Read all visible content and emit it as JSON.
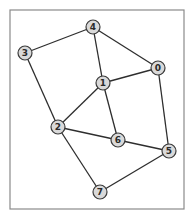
{
  "diagram": {
    "type": "undirected-graph",
    "frame": {
      "x": 10,
      "y": 10,
      "width": 174,
      "height": 199,
      "stroke": "#8a8a8a"
    },
    "style": {
      "edge_color": "#2e2e2e",
      "node_fill": "#d9d9d9",
      "node_stroke": "#3a3a3a",
      "node_radius": 7
    },
    "nodes": [
      {
        "id": "0",
        "label": "0",
        "x": 158,
        "y": 68
      },
      {
        "id": "1",
        "label": "1",
        "x": 103,
        "y": 83
      },
      {
        "id": "2",
        "label": "2",
        "x": 58,
        "y": 127
      },
      {
        "id": "3",
        "label": "3",
        "x": 25,
        "y": 53
      },
      {
        "id": "4",
        "label": "4",
        "x": 93,
        "y": 27
      },
      {
        "id": "5",
        "label": "5",
        "x": 169,
        "y": 151
      },
      {
        "id": "6",
        "label": "6",
        "x": 118,
        "y": 140
      },
      {
        "id": "7",
        "label": "7",
        "x": 100,
        "y": 192
      }
    ],
    "edges": [
      [
        "4",
        "3"
      ],
      [
        "4",
        "1"
      ],
      [
        "4",
        "0"
      ],
      [
        "3",
        "2"
      ],
      [
        "1",
        "0"
      ],
      [
        "1",
        "2"
      ],
      [
        "1",
        "6"
      ],
      [
        "0",
        "5"
      ],
      [
        "2",
        "6"
      ],
      [
        "2",
        "7"
      ],
      [
        "6",
        "5"
      ],
      [
        "5",
        "7"
      ]
    ]
  }
}
